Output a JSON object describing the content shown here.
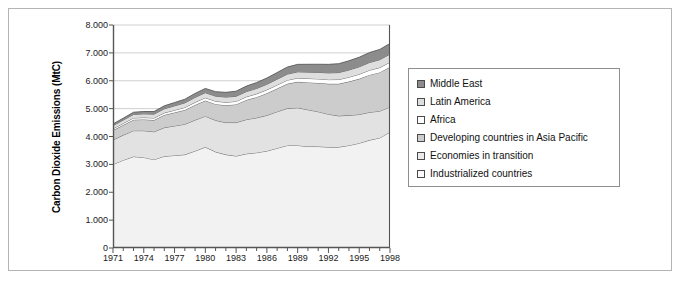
{
  "chart_data": {
    "type": "area",
    "stacked": true,
    "title": "",
    "xlabel": "",
    "ylabel": "Carbon Dioxide Emissions (MtC)",
    "ylim": [
      0,
      8000
    ],
    "yticks": [
      0,
      1000,
      2000,
      3000,
      4000,
      5000,
      6000,
      7000,
      8000
    ],
    "ytick_labels": [
      "0",
      "1.000",
      "2.000",
      "3.000",
      "4.000",
      "5.000",
      "6.000",
      "7.000",
      "8.000"
    ],
    "xlim": [
      1971,
      1998
    ],
    "x": [
      1971,
      1972,
      1973,
      1974,
      1975,
      1976,
      1977,
      1978,
      1979,
      1980,
      1981,
      1982,
      1983,
      1984,
      1985,
      1986,
      1987,
      1988,
      1989,
      1990,
      1991,
      1992,
      1993,
      1994,
      1995,
      1996,
      1997,
      1998
    ],
    "xtick_labels": [
      "1971",
      "1974",
      "1977",
      "1980",
      "1983",
      "1986",
      "1989",
      "1992",
      "1995",
      "1998"
    ],
    "xticks": [
      1971,
      1974,
      1977,
      1980,
      1983,
      1986,
      1989,
      1992,
      1995,
      1998
    ],
    "grid": "horizontal",
    "gridlines": [
      5000,
      6000,
      7000,
      8000
    ],
    "legend_position": "right-outside",
    "series": [
      {
        "name": "Industrialized countries",
        "color": "#f2f2f2",
        "values": [
          3000,
          3150,
          3280,
          3250,
          3170,
          3290,
          3320,
          3350,
          3480,
          3620,
          3450,
          3350,
          3300,
          3380,
          3420,
          3480,
          3580,
          3680,
          3680,
          3640,
          3640,
          3620,
          3620,
          3680,
          3760,
          3870,
          3950,
          4160
        ]
      },
      {
        "name": "Economies in transition",
        "color": "#e2e2e2",
        "values": [
          880,
          900,
          930,
          960,
          1000,
          1030,
          1060,
          1090,
          1110,
          1110,
          1130,
          1150,
          1200,
          1230,
          1250,
          1280,
          1310,
          1330,
          1350,
          1320,
          1250,
          1180,
          1120,
          1080,
          1030,
          1000,
          960,
          900
        ]
      },
      {
        "name": "Developing countries in Asia Pacific",
        "color": "#cccccc",
        "values": [
          340,
          360,
          390,
          400,
          420,
          450,
          480,
          510,
          540,
          560,
          580,
          620,
          650,
          700,
          740,
          790,
          830,
          880,
          930,
          980,
          1030,
          1090,
          1150,
          1210,
          1280,
          1340,
          1390,
          1430
        ]
      },
      {
        "name": "Africa",
        "color": "#ffffff",
        "values": [
          60,
          62,
          66,
          70,
          74,
          78,
          84,
          90,
          96,
          100,
          104,
          108,
          110,
          114,
          120,
          124,
          128,
          132,
          138,
          142,
          146,
          150,
          154,
          158,
          164,
          168,
          172,
          176
        ]
      },
      {
        "name": "Latin America",
        "color": "#dedede",
        "values": [
          110,
          118,
          126,
          132,
          138,
          146,
          156,
          166,
          176,
          182,
          184,
          186,
          184,
          188,
          194,
          200,
          208,
          216,
          222,
          228,
          234,
          242,
          250,
          258,
          266,
          276,
          284,
          290
        ]
      },
      {
        "name": "Middle East",
        "color": "#8c8c8c",
        "values": [
          60,
          68,
          78,
          86,
          94,
          106,
          118,
          130,
          142,
          152,
          160,
          170,
          180,
          196,
          210,
          224,
          238,
          254,
          268,
          280,
          292,
          306,
          318,
          330,
          344,
          356,
          368,
          380
        ]
      }
    ]
  },
  "legend": {
    "items": [
      {
        "label": "Middle East",
        "color": "#8c8c8c"
      },
      {
        "label": "Latin America",
        "color": "#dedede"
      },
      {
        "label": "Africa",
        "color": "#ffffff"
      },
      {
        "label": "Developing countries in Asia Pacific",
        "color": "#cccccc"
      },
      {
        "label": "Economies in transition",
        "color": "#eaeaea"
      },
      {
        "label": "Industrialized countries",
        "color": "#fbfbfb"
      }
    ]
  },
  "colors": {
    "frame_border": "#b4b4b4",
    "axis": "#555555",
    "gridline": "#cfcfcf",
    "series_outline": "#5a5a5a",
    "legend_border": "#8e8e8e",
    "background": "#ffffff"
  }
}
